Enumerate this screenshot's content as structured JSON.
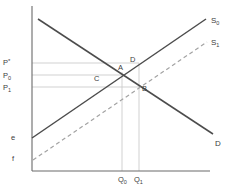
{
  "page": {
    "background": "#ffffff"
  },
  "chart": {
    "width": 229,
    "height": 193,
    "colors": {
      "axis": "#6a6a6a",
      "curve": "#4c4c4c",
      "dashed_curve": "#a3a3a3",
      "ref_line": "#cccccc",
      "text": "#3c3c3c"
    },
    "axes": {
      "y": {
        "x": 32,
        "y1": 6,
        "y2": 171
      },
      "x": {
        "y": 171,
        "x1": 32,
        "x2": 210
      }
    }
  },
  "chart_data": {
    "type": "line",
    "title": "",
    "series": [
      {
        "id": "demand",
        "label_main": "D",
        "label_sub": "",
        "line_style": "solid",
        "points": [
          [
            38,
            19
          ],
          [
            213,
            134
          ]
        ],
        "label_x": 215,
        "label_y": 146
      },
      {
        "id": "supply-s0",
        "label_main": "S",
        "label_sub": "0",
        "line_style": "solid",
        "points": [
          [
            32,
            138
          ],
          [
            206,
            19
          ]
        ],
        "label_x": 211,
        "label_y": 23
      },
      {
        "id": "supply-s1",
        "label_main": "S",
        "label_sub": "1",
        "line_style": "dashed",
        "points": [
          [
            33,
            160
          ],
          [
            207,
            42
          ]
        ],
        "label_x": 211,
        "label_y": 45
      }
    ],
    "y_axis_labels": [
      {
        "id": "p-star",
        "main": "P",
        "sup": "*",
        "sub": "",
        "x": 3,
        "y": 65
      },
      {
        "id": "p0",
        "main": "P",
        "sup": "",
        "sub": "0",
        "x": 3,
        "y": 78
      },
      {
        "id": "p1",
        "main": "P",
        "sup": "",
        "sub": "1",
        "x": 3,
        "y": 90
      },
      {
        "id": "e",
        "main": "e",
        "sup": "",
        "sub": "",
        "x": 11,
        "y": 140
      },
      {
        "id": "f",
        "main": "f",
        "sup": "",
        "sub": "",
        "x": 12,
        "y": 161
      }
    ],
    "x_axis_labels": [
      {
        "id": "q0",
        "main": "Q",
        "sub": "0",
        "x": 118,
        "y": 182
      },
      {
        "id": "q1",
        "main": "Q",
        "sub": "1",
        "x": 134,
        "y": 182
      }
    ],
    "reference_lines": {
      "horizontal": [
        {
          "id": "p-star-line",
          "y": 63,
          "x1": 32,
          "x2": 139
        },
        {
          "id": "p0-line",
          "y": 75,
          "x1": 32,
          "x2": 122
        },
        {
          "id": "p1-line",
          "y": 87,
          "x1": 32,
          "x2": 140
        }
      ],
      "vertical": [
        {
          "id": "q0-line",
          "x": 122,
          "y1": 72,
          "y2": 171
        },
        {
          "id": "q1-line",
          "x": 139,
          "y1": 63,
          "y2": 171
        }
      ]
    },
    "point_labels": [
      {
        "id": "point-a",
        "text": "A",
        "x": 118,
        "y": 70
      },
      {
        "id": "point-b",
        "text": "B",
        "x": 142,
        "y": 91
      },
      {
        "id": "point-c",
        "text": "C",
        "x": 94,
        "y": 81
      },
      {
        "id": "point-d",
        "text": "D",
        "x": 130,
        "y": 62
      }
    ]
  }
}
